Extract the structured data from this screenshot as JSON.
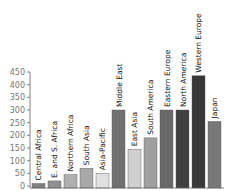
{
  "chart_data": {
    "type": "bar",
    "title": "",
    "xlabel": "",
    "ylabel": "",
    "ylim": [
      0,
      450
    ],
    "yticks": [
      0,
      50,
      100,
      150,
      200,
      250,
      300,
      350,
      400,
      450
    ],
    "grid": false,
    "legend": null,
    "categories": [
      "Central Africa",
      "E. and S. Africa",
      "Northern Africa",
      "South Asia",
      "Asia-Pacific",
      "Middle East",
      "East Asia",
      "South America",
      "Eastern Europe",
      "North America",
      "Western Europe",
      "Japan"
    ],
    "values": [
      10,
      20,
      45,
      70,
      50,
      300,
      145,
      190,
      300,
      300,
      435,
      255
    ],
    "colors": [
      "#808080",
      "#909090",
      "#b0b0b0",
      "#a8a8a8",
      "#e0e0e0",
      "#707070",
      "#d0d0d0",
      "#a0a0a0",
      "#686868",
      "#404040",
      "#383838",
      "#787878"
    ],
    "label_orientation": "vertical, above bars"
  }
}
